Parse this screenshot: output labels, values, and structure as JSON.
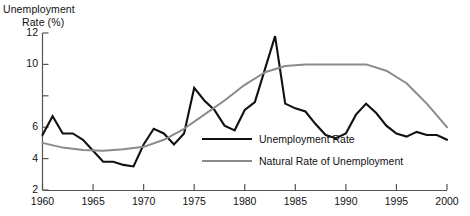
{
  "chart_data": {
    "type": "line",
    "title": "",
    "ylabel_line1": "Unemployment",
    "ylabel_line2": "Rate (%)",
    "xlabel": "",
    "xlim": [
      1960,
      2000
    ],
    "ylim": [
      2,
      12
    ],
    "grid": false,
    "legend_position": "center-right",
    "yticks": [
      2,
      4,
      6,
      8,
      10,
      12
    ],
    "ytick_labels": [
      "2",
      "4",
      "6",
      "",
      "10",
      "12"
    ],
    "xticks": [
      1960,
      1965,
      1970,
      1975,
      1980,
      1985,
      1990,
      1995,
      2000
    ],
    "xtick_labels": [
      "1960",
      "1965",
      "1970",
      "1975",
      "1980",
      "1985",
      "1990",
      "1995",
      "2000"
    ],
    "series": [
      {
        "name": "Unemployment Rate",
        "color": "#111111",
        "width": 2.1,
        "x": [
          1960,
          1961,
          1962,
          1963,
          1964,
          1965,
          1966,
          1967,
          1968,
          1969,
          1970,
          1971,
          1972,
          1973,
          1974,
          1975,
          1976,
          1977,
          1978,
          1979,
          1980,
          1981,
          1982,
          1983,
          1984,
          1985,
          1986,
          1987,
          1988,
          1989,
          1990,
          1991,
          1992,
          1993,
          1994,
          1995,
          1996,
          1997,
          1998,
          1999,
          2000
        ],
        "values": [
          5.5,
          6.7,
          5.6,
          5.6,
          5.2,
          4.5,
          3.8,
          3.8,
          3.6,
          3.5,
          4.9,
          5.9,
          5.6,
          4.9,
          5.6,
          8.5,
          7.7,
          7.1,
          6.1,
          5.8,
          7.1,
          7.6,
          9.7,
          11.8,
          7.5,
          7.2,
          7.0,
          6.2,
          5.5,
          5.3,
          5.6,
          6.8,
          7.5,
          6.9,
          6.1,
          5.6,
          5.4,
          5.7,
          5.5,
          5.5,
          5.2
        ]
      },
      {
        "name": "Natural Rate of Unemployment",
        "color": "#8a8a8a",
        "width": 2.0,
        "x": [
          1960,
          1962,
          1964,
          1966,
          1968,
          1970,
          1972,
          1974,
          1976,
          1978,
          1980,
          1982,
          1984,
          1986,
          1988,
          1990,
          1992,
          1994,
          1996,
          1998,
          2000
        ],
        "values": [
          5.0,
          4.7,
          4.55,
          4.5,
          4.6,
          4.75,
          5.2,
          5.9,
          6.8,
          7.7,
          8.7,
          9.5,
          9.9,
          10.0,
          10.0,
          10.0,
          10.0,
          9.6,
          8.8,
          7.5,
          6.0
        ]
      }
    ]
  },
  "legend": {
    "items": [
      {
        "label": "Unemployment Rate",
        "color": "#111111"
      },
      {
        "label": "Natural Rate of Unemployment",
        "color": "#8a8a8a"
      }
    ]
  }
}
